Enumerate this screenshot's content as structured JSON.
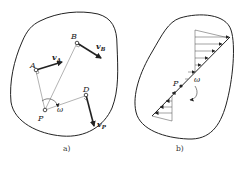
{
  "figures": [
    {
      "id": "a",
      "caption": "a)",
      "points": {
        "A": "A",
        "B": "B",
        "D": "D",
        "P": "P"
      },
      "vectors": {
        "vA": "v",
        "vA_sub": "A",
        "vB": "v",
        "vB_sub": "B",
        "vP": "v",
        "vP_sub": "P"
      },
      "angular_velocity": "ω"
    },
    {
      "id": "b",
      "caption": "b)",
      "points": {
        "P": "P"
      },
      "angular_velocity": "ω"
    }
  ],
  "colors": {
    "stroke": "#222222",
    "thin": "#555555",
    "background": "#ffffff"
  }
}
